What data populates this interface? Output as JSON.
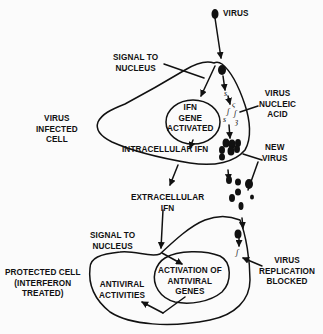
{
  "diagram": {
    "colors": {
      "ink": "#111111",
      "background": "#fbfbfb"
    },
    "labels": {
      "virus_top": "VIRUS",
      "signal_top": "SIGNAL TO\nNUCLEUS",
      "virus_infected_cell": "VIRUS\nINFECTED\nCELL",
      "ifn_gene_activated": "IFN\nGENE\nACTIVATED",
      "virus_nucleic_acid": "VIRUS\nNUCLEIC\nACID",
      "intracellular_ifn": "INTRACELLULAR IFN",
      "new_virus": "NEW\nVIRUS",
      "extracellular_ifn": "EXTRACELLULAR\nIFN",
      "signal_bottom": "SIGNAL TO\nNUCLEUS",
      "protected_cell": "PROTECTED CELL\n(INTERFERON\nTREATED)",
      "activation_antiviral": "ACTIVATION OF\nANTIVIRAL\nGENES",
      "antiviral_activities": "ANTIVIRAL\nACTIVITIES",
      "virus_replication_blocked": "VIRUS\nREPLICATION\nBLOCKED"
    }
  }
}
